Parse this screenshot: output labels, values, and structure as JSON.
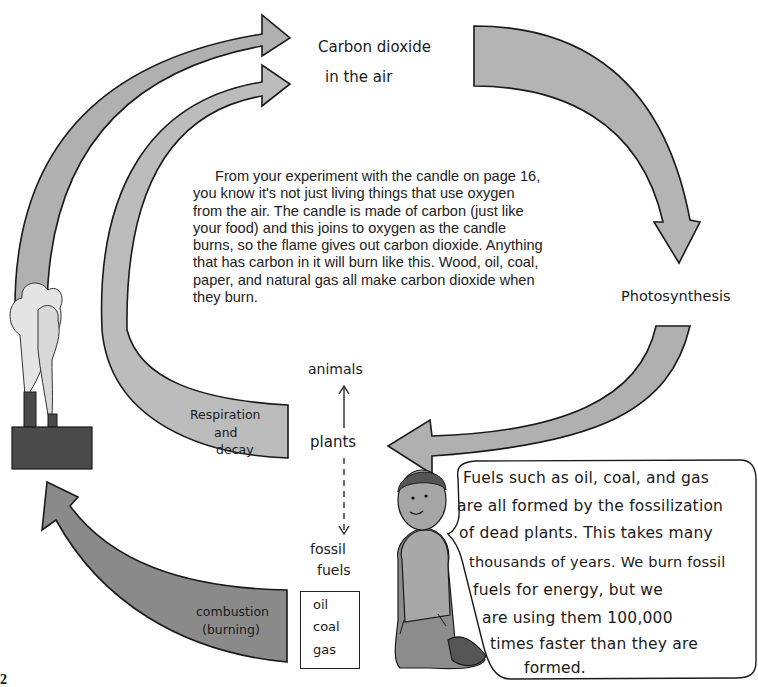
{
  "diagram": {
    "title_label": {
      "line1": "Carbon dioxide",
      "line2": "in the air"
    },
    "photosynthesis_label": "Photosynthesis",
    "respiration_label": {
      "line1": "Respiration",
      "line2": "and",
      "line3": "decay"
    },
    "combustion_label": {
      "line1": "combustion",
      "line2": "(burning)"
    },
    "food_chain": {
      "top": "animals",
      "middle": "plants",
      "bottom_line1": "fossil",
      "bottom_line2": "fuels"
    },
    "fuel_box": [
      "oil",
      "coal",
      "gas"
    ],
    "body_paragraph": "From your experiment with the candle on page 16, you know it's not just living things that use oxygen from the air.  The candle is made of carbon (just like your food) and this joins to oxygen as the candle burns, so the flame gives out carbon dioxide.  Anything that has carbon in it will burn like this.  Wood, oil, coal, paper, and natural gas all make carbon dioxide when they burn.",
    "speech_bubble": {
      "lines": [
        "Fuels such as oil, coal, and gas",
        "are all formed by the fossilization",
        "of dead plants. This takes many",
        "thousands of years. We burn fossil",
        "fuels for energy, but we",
        "are using them 100,000",
        "times faster than they are",
        "formed."
      ]
    },
    "page_number": "2",
    "colors": {
      "arrow_light": "#b4b4b4",
      "arrow_medium": "#a6a6a6",
      "arrow_dark": "#7a7a7a",
      "factory": "#4a4a4a",
      "outline": "#1a1a1a"
    }
  }
}
